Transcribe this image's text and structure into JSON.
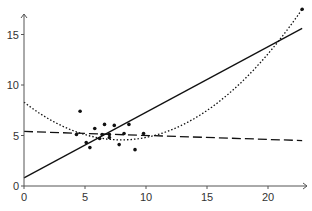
{
  "chart_data": {
    "type": "scatter",
    "title": "",
    "xlabel": "",
    "ylabel": "",
    "xlim": [
      0,
      23
    ],
    "ylim": [
      0,
      17.5
    ],
    "grid": false,
    "legend": null,
    "x_ticks": [
      0,
      5,
      10,
      15,
      20
    ],
    "y_ticks": [
      0,
      5,
      10,
      15
    ],
    "x_tick_labels": [
      "0",
      "5",
      "10",
      "15",
      "20"
    ],
    "y_tick_labels": [
      "0",
      "5",
      "10",
      "15"
    ],
    "series": [
      {
        "name": "data points",
        "kind": "scatter",
        "x": [
          4.3,
          4.6,
          5.1,
          5.4,
          5.8,
          6.2,
          6.4,
          6.6,
          7.0,
          7.0,
          7.4,
          7.8,
          8.2,
          8.6,
          9.1,
          9.8,
          22.8
        ],
        "y": [
          5.1,
          7.4,
          4.3,
          3.8,
          5.7,
          4.7,
          5.1,
          6.1,
          5.1,
          4.8,
          6.0,
          4.1,
          5.2,
          6.1,
          3.6,
          5.2,
          17.5
        ]
      },
      {
        "name": "linear fit (with outlier)",
        "kind": "line",
        "style": "solid",
        "x": [
          0,
          22.8
        ],
        "y": [
          0.8,
          15.6
        ]
      },
      {
        "name": "linear fit (robust)",
        "kind": "line",
        "style": "dashed",
        "x": [
          0,
          22.8
        ],
        "y": [
          5.4,
          4.5
        ]
      },
      {
        "name": "quadratic fit",
        "kind": "curve",
        "style": "dotted",
        "coefficients": [
          8.3,
          -0.937,
          0.0588
        ],
        "x_range": [
          0,
          22.8
        ]
      }
    ]
  },
  "axes": {
    "color": "#555555",
    "line_color": "#111111"
  }
}
